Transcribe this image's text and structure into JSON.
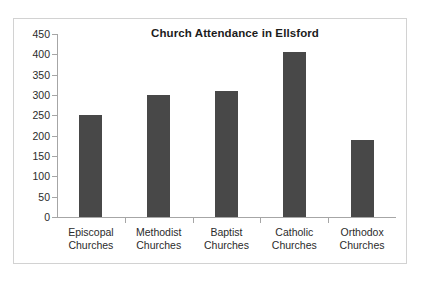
{
  "chart_data": {
    "type": "bar",
    "title": "Church Attendance in Ellsford",
    "xlabel": "",
    "ylabel": "",
    "categories": [
      "Episcopal Churches",
      "Methodist Churches",
      "Baptist Churches",
      "Catholic Churches",
      "Orthodox Churches"
    ],
    "category_lines": [
      [
        "Episcopal",
        "Churches"
      ],
      [
        "Methodist",
        "Churches"
      ],
      [
        "Baptist",
        "Churches"
      ],
      [
        "Catholic",
        "Churches"
      ],
      [
        "Orthodox",
        "Churches"
      ]
    ],
    "values": [
      250,
      300,
      310,
      405,
      190
    ],
    "ylim": [
      0,
      450
    ],
    "ytick_step": 50,
    "yticks": [
      0,
      50,
      100,
      150,
      200,
      250,
      300,
      350,
      400,
      450
    ],
    "ytick_labels": [
      "0",
      "50",
      "100",
      "150",
      "200",
      "250",
      "300",
      "350",
      "400",
      "450"
    ],
    "grid": false,
    "legend": false,
    "bar_color": "#484848",
    "axis_color": "#a6a6a6",
    "title_color": "#1c1c1c",
    "border_color": "#d2d2d2",
    "background": "#ffffff"
  }
}
